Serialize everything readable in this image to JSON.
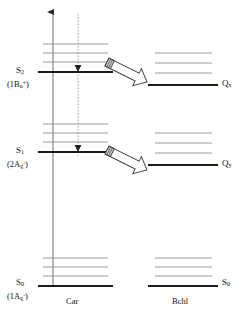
{
  "figure": {
    "type": "energy-level-diagram",
    "title": "",
    "columns": [
      {
        "id": "car",
        "label": "Car",
        "x": 78
      },
      {
        "id": "bchl",
        "label": "Bchl",
        "x": 185
      }
    ],
    "axis": {
      "name": "energy-axis",
      "direction": "up",
      "x": 53,
      "y_top": 12,
      "y_bottom": 286
    },
    "dotted_path": {
      "name": "internal-conversion-path",
      "x": 78,
      "y_top": 14,
      "y_bottom": 156,
      "style": "dotted",
      "arrowheads": [
        "S2",
        "S1"
      ]
    },
    "car_levels": [
      {
        "id": "S2",
        "label": "S",
        "sub": "2",
        "term_open": "(1B",
        "term_sub": "u",
        "term_sup": "+",
        "term_close": ")",
        "y": 72,
        "x1": 38,
        "x2": 113,
        "vib_offsets": [
          -10,
          -19,
          -28
        ],
        "vib_x1": 43,
        "vib_x2": 108
      },
      {
        "id": "S1",
        "label": "S",
        "sub": "1",
        "term_open": "(2A",
        "term_sub": "g",
        "term_sup": "-",
        "term_close": ")",
        "y": 152,
        "x1": 38,
        "x2": 113,
        "vib_offsets": [
          -10,
          -19,
          -28
        ],
        "vib_x1": 43,
        "vib_x2": 108
      },
      {
        "id": "S0",
        "label": "S",
        "sub": "0",
        "term_open": "(1A",
        "term_sub": "g",
        "term_sup": "-",
        "term_close": ")",
        "y": 286,
        "x1": 38,
        "x2": 113,
        "vib_offsets": [
          -10,
          -19,
          -28
        ],
        "vib_x1": 43,
        "vib_x2": 108
      }
    ],
    "bchl_levels": [
      {
        "id": "Qx",
        "label": "Q",
        "sub": "x",
        "y": 85,
        "x1": 148,
        "x2": 218,
        "vib_offsets": [
          -12,
          -22,
          -32
        ],
        "vib_x1": 155,
        "vib_x2": 212
      },
      {
        "id": "Qy",
        "label": "Q",
        "sub": "y",
        "y": 165,
        "x1": 148,
        "x2": 218,
        "vib_offsets": [
          -12,
          -22,
          -32
        ],
        "vib_x1": 155,
        "vib_x2": 212
      },
      {
        "id": "S0b",
        "label": "S",
        "sub": "0",
        "y": 286,
        "x1": 148,
        "x2": 218,
        "vib_offsets": [
          -10,
          -19,
          -28
        ],
        "vib_x1": 155,
        "vib_x2": 212
      }
    ],
    "transfer_arrows": [
      {
        "id": "transfer-s2-qx",
        "from": "S2",
        "to": "Qx",
        "x1": 107,
        "y1": 62,
        "x2": 147,
        "y2": 82
      },
      {
        "id": "transfer-s1-qy",
        "from": "S1",
        "to": "Qy",
        "x1": 107,
        "y1": 150,
        "x2": 147,
        "y2": 170
      }
    ],
    "colors": {
      "level_stroke": "#1a1a1a",
      "vib_stroke": "#8f8f8f",
      "axis_stroke": "#6f6f6f",
      "arrow_stroke": "#3a3a3a",
      "arrow_fill": "#ffffff",
      "background": "#ffffff"
    },
    "labels": {
      "car_column": "Car",
      "bchl_column": "Bchl"
    }
  },
  "chart_data": {
    "type": "diagram",
    "xlabel": "",
    "ylabel": "Energy",
    "categories": [
      "Car",
      "Bchl"
    ],
    "series": [
      {
        "name": "Car",
        "levels": [
          {
            "state": "S2",
            "term": "(1Bu+)",
            "relative_energy": 0.78,
            "vibrational_sublevels": 3
          },
          {
            "state": "S1",
            "term": "(2Ag-)",
            "relative_energy": 0.49,
            "vibrational_sublevels": 3
          },
          {
            "state": "S0",
            "term": "(1Ag-)",
            "relative_energy": 0.0,
            "vibrational_sublevels": 3
          }
        ]
      },
      {
        "name": "Bchl",
        "levels": [
          {
            "state": "Qx",
            "term": "",
            "relative_energy": 0.73,
            "vibrational_sublevels": 3
          },
          {
            "state": "Qy",
            "term": "",
            "relative_energy": 0.44,
            "vibrational_sublevels": 3
          },
          {
            "state": "S0",
            "term": "",
            "relative_energy": 0.0,
            "vibrational_sublevels": 3
          }
        ]
      }
    ],
    "transitions": [
      {
        "kind": "absorption",
        "from": "S0",
        "to": "S2",
        "column": "Car",
        "style": "solid-up-arrow"
      },
      {
        "kind": "internal-conversion",
        "from": "S2",
        "to": "S1",
        "column": "Car",
        "style": "dotted-down-arrow"
      },
      {
        "kind": "energy-transfer",
        "from": "Car S2",
        "to": "Bchl Qx",
        "style": "hollow-block-arrow"
      },
      {
        "kind": "energy-transfer",
        "from": "Car S1",
        "to": "Bchl Qy",
        "style": "hollow-block-arrow"
      }
    ],
    "legend": [],
    "grid": false
  }
}
